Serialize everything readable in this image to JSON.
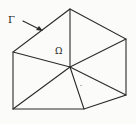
{
  "diagram": {
    "type": "triangulated-domain",
    "labels": {
      "boundary": "Γ",
      "domain": "Ω",
      "mark": "-"
    },
    "vertices": {
      "top": [
        70,
        9
      ],
      "right_top": [
        126,
        39
      ],
      "left_top": [
        13,
        52
      ],
      "center": [
        70,
        67
      ],
      "right_bottom": [
        126,
        95
      ],
      "bottom_mid": [
        84,
        109
      ],
      "bottom_left": [
        13,
        109
      ]
    },
    "boundary_polygon": [
      "top",
      "right_top",
      "right_bottom",
      "bottom_mid",
      "bottom_left",
      "left_top"
    ],
    "interior_edges": [
      [
        "top",
        "center"
      ],
      [
        "left_top",
        "center"
      ],
      [
        "right_top",
        "center"
      ],
      [
        "right_bottom",
        "center"
      ],
      [
        "bottom_mid",
        "center"
      ],
      [
        "bottom_left",
        "center"
      ]
    ],
    "arrow": {
      "from": [
        23,
        21
      ],
      "to": [
        42,
        30
      ],
      "points_to": "boundary"
    }
  }
}
